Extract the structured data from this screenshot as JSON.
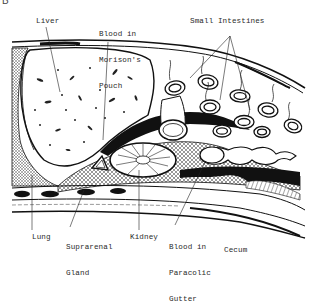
{
  "figure": {
    "panel_letter": "B",
    "colors": {
      "ink": "#111111",
      "paper": "#ffffff",
      "label": "#2a2a2a",
      "stipple": "#555555"
    }
  },
  "labels": {
    "liver": "Liver",
    "morison_l1": "Blood in",
    "morison_l2": "Morison's",
    "morison_l3": "Pouch",
    "small_intestines": "Small Intestines",
    "lung": "Lung",
    "suprarenal_l1": "Suprarenal",
    "suprarenal_l2": "Gland",
    "kidney": "Kidney",
    "paracolic_l1": "Blood in",
    "paracolic_l2": "Paracolic",
    "paracolic_l3": "Gutter",
    "cecum": "Cecum"
  }
}
